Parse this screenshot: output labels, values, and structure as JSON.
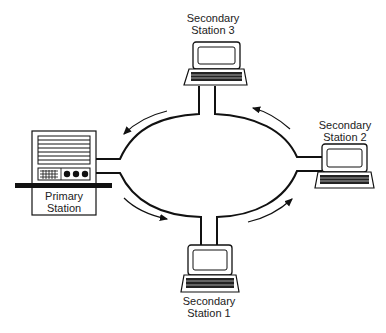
{
  "diagram": {
    "primary": {
      "line1": "Primary",
      "line2": "Station"
    },
    "stations": [
      {
        "line1": "Secondary",
        "line2": "Station 1"
      },
      {
        "line1": "Secondary",
        "line2": "Station 2"
      },
      {
        "line1": "Secondary",
        "line2": "Station 3"
      }
    ],
    "flow_direction": "counter-clockwise",
    "colors": {
      "line": "#111111",
      "background": "#ffffff"
    }
  }
}
